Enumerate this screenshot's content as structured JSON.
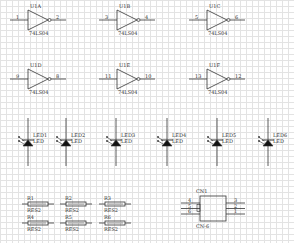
{
  "schematic": {
    "grid_color": "#e3e3e3",
    "wire_color": "#333333",
    "inverters": [
      {
        "ref": "U1A",
        "part": "74LS04",
        "in_pin": "1",
        "out_pin": "2",
        "x": 28,
        "y": 20
      },
      {
        "ref": "U1B",
        "part": "74LS04",
        "in_pin": "3",
        "out_pin": "4",
        "x": 117,
        "y": 20
      },
      {
        "ref": "U1C",
        "part": "74LS04",
        "in_pin": "5",
        "out_pin": "6",
        "x": 207,
        "y": 20
      },
      {
        "ref": "U1D",
        "part": "74LS04",
        "in_pin": "9",
        "out_pin": "8",
        "x": 28,
        "y": 79
      },
      {
        "ref": "U1E",
        "part": "74LS04",
        "in_pin": "11",
        "out_pin": "10",
        "x": 117,
        "y": 79
      },
      {
        "ref": "U1F",
        "part": "74LS04",
        "in_pin": "13",
        "out_pin": "12",
        "x": 207,
        "y": 79
      }
    ],
    "leds": [
      {
        "ref": "LED1",
        "value": "LED",
        "x": 28
      },
      {
        "ref": "LED2",
        "value": "LED",
        "x": 66
      },
      {
        "ref": "LED3",
        "value": "LED",
        "x": 116
      },
      {
        "ref": "LED4",
        "value": "LED",
        "x": 167
      },
      {
        "ref": "LED5",
        "value": "LED",
        "x": 217
      },
      {
        "ref": "LED6",
        "value": "LED",
        "x": 268
      }
    ],
    "resistors": [
      {
        "ref": "R1",
        "value": "RES2",
        "x": 22,
        "y": 204
      },
      {
        "ref": "R2",
        "value": "RES2",
        "x": 60,
        "y": 204
      },
      {
        "ref": "R3",
        "value": "RES2",
        "x": 99,
        "y": 204
      },
      {
        "ref": "R4",
        "value": "RES2",
        "x": 22,
        "y": 223
      },
      {
        "ref": "R5",
        "value": "RES2",
        "x": 60,
        "y": 223
      },
      {
        "ref": "R6",
        "value": "RES2",
        "x": 99,
        "y": 223
      }
    ],
    "connector": {
      "ref": "CN1",
      "part": "CN-6",
      "left_pins": [
        "4",
        "5",
        "6"
      ],
      "right_pins": [
        "3",
        "2",
        "1"
      ]
    }
  }
}
